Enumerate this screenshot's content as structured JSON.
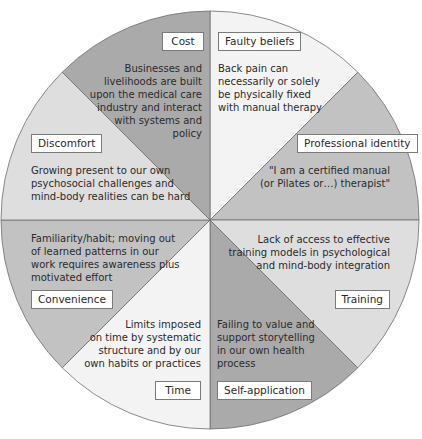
{
  "diagram": {
    "type": "wheel",
    "segments": [
      {
        "id": "faulty_beliefs",
        "label": "Faulty beliefs",
        "description": "Back pain can necessarily or solely be physically fixed with manual therapy",
        "color": "#f3f3f3"
      },
      {
        "id": "professional_identity",
        "label": "Professional identity",
        "description": "\"I am a certified manual (or Pilates or…) therapist\"",
        "color": "#c2c2c2"
      },
      {
        "id": "training",
        "label": "Training",
        "description": "Lack of access to effective training models in psychological and mind-body integration",
        "color": "#dedede"
      },
      {
        "id": "self_application",
        "label": "Self-application",
        "description": "Failing to value and support storytelling in our own health process",
        "color": "#aaaaaa"
      },
      {
        "id": "time",
        "label": "Time",
        "description": "Limits imposed on time by systematic structure and by our own habits or practices",
        "color": "#f3f3f3"
      },
      {
        "id": "convenience",
        "label": "Convenience",
        "description": "Familiarity/habit; moving out of learned patterns in our work requires awareness plus motivated effort",
        "color": "#c2c2c2"
      },
      {
        "id": "discomfort",
        "label": "Discomfort",
        "description": "Growing present to our own psychosocial challenges and mind-body realities can be hard",
        "color": "#dedede"
      },
      {
        "id": "cost",
        "label": "Cost",
        "description": "Businesses and livelihoods are built upon the medical care industry and interact with systems and policy",
        "color": "#aaaaaa"
      }
    ]
  },
  "text": {
    "cost_label": "Cost",
    "cost_lines": [
      "Businesses and",
      "livelihoods are built",
      "upon the medical care",
      "industry and interact",
      "with systems and",
      "policy"
    ],
    "faulty_label": "Faulty beliefs",
    "faulty_lines": [
      "Back pain can",
      "necessarily or solely",
      "be physically fixed",
      "with manual therapy"
    ],
    "discomfort_label": "Discomfort",
    "discomfort_lines": [
      "Growing present to our own",
      "psychosocial challenges and",
      "mind-body realities can be hard"
    ],
    "profid_label": "Professional identity",
    "profid_lines": [
      "\"I am a certified manual",
      "(or Pilates or…) therapist\""
    ],
    "convenience_label": "Convenience",
    "convenience_lines": [
      "Familiarity/habit; moving out",
      "of learned patterns in our",
      "work requires awareness plus",
      "motivated effort"
    ],
    "training_label": "Training",
    "training_lines": [
      "Lack of access to effective",
      "training models in psychological",
      "and mind-body integration"
    ],
    "time_label": "Time",
    "time_lines": [
      "Limits imposed",
      "on time by systematic",
      "structure and by our",
      "own habits or practices"
    ],
    "selfapp_label": "Self-application",
    "selfapp_lines": [
      "Failing to value and",
      "support storytelling",
      "in our own health",
      "process"
    ]
  }
}
